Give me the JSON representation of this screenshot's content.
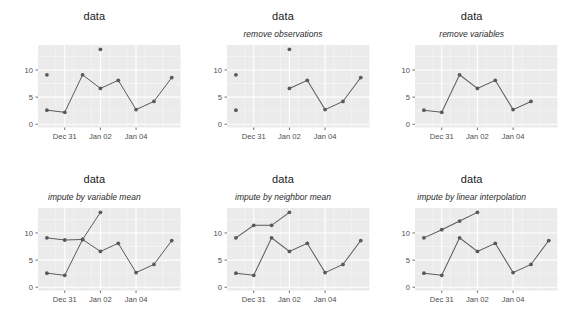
{
  "figure": {
    "background": "#ffffff",
    "panel_background": "#ebebeb",
    "grid_color": "#ffffff",
    "series_color": "#595959",
    "axis_text_color": "#4d4d4d",
    "rows": 2,
    "cols": 3
  },
  "panels": [
    {
      "id": "panel-data-original",
      "title": "data",
      "subtitle": ""
    },
    {
      "id": "panel-remove-observations",
      "title": "data",
      "subtitle": "remove observations"
    },
    {
      "id": "panel-remove-variables",
      "title": "data",
      "subtitle": "remove variables"
    },
    {
      "id": "panel-impute-variable-mean",
      "title": "data",
      "subtitle": "impute by variable mean"
    },
    {
      "id": "panel-impute-neighbor-mean",
      "title": "data",
      "subtitle": "impute by neighbor mean"
    },
    {
      "id": "panel-impute-linear-interp",
      "title": "data",
      "subtitle": "impute by linear interpolation"
    }
  ],
  "chart_data": [
    {
      "type": "line",
      "title": "data",
      "subtitle": "",
      "xlabel": "",
      "ylabel": "",
      "x": [
        0,
        1,
        2,
        3,
        4,
        5,
        6,
        7
      ],
      "xtick_positions": [
        1,
        3,
        5
      ],
      "xtick_labels": [
        "Dec 31",
        "Jan 02",
        "Jan 04"
      ],
      "ytick_labels": [
        "0",
        "5",
        "10"
      ],
      "ytick_values": [
        0,
        5,
        10
      ],
      "ylim": [
        -0.6,
        14.6
      ],
      "grid": true,
      "legend": "none",
      "series": [
        {
          "name": "series-a",
          "values": [
            9.1,
            null,
            null,
            13.8,
            null,
            null,
            null,
            null
          ]
        },
        {
          "name": "series-b",
          "values": [
            2.6,
            2.2,
            9.1,
            6.6,
            8.1,
            2.7,
            4.2,
            8.6
          ]
        }
      ]
    },
    {
      "type": "line",
      "title": "data",
      "subtitle": "remove observations",
      "xlabel": "",
      "ylabel": "",
      "x": [
        0,
        1,
        2,
        3,
        4,
        5,
        6,
        7
      ],
      "xtick_positions": [
        1,
        3,
        5
      ],
      "xtick_labels": [
        "Dec 31",
        "Jan 02",
        "Jan 04"
      ],
      "ytick_labels": [
        "0",
        "5",
        "10"
      ],
      "ytick_values": [
        0,
        5,
        10
      ],
      "ylim": [
        -0.6,
        14.6
      ],
      "grid": true,
      "legend": "none",
      "series": [
        {
          "name": "series-a",
          "values": [
            9.1,
            null,
            null,
            13.8,
            null,
            null,
            null,
            null
          ]
        },
        {
          "name": "series-b",
          "values": [
            2.6,
            null,
            null,
            6.6,
            8.1,
            2.7,
            4.2,
            8.6
          ]
        }
      ]
    },
    {
      "type": "line",
      "title": "data",
      "subtitle": "remove variables",
      "xlabel": "",
      "ylabel": "",
      "x": [
        0,
        1,
        2,
        3,
        4,
        5,
        6,
        7
      ],
      "xtick_positions": [
        1,
        3,
        5
      ],
      "xtick_labels": [
        "Dec 31",
        "Jan 02",
        "Jan 04"
      ],
      "ytick_labels": [
        "0",
        "5",
        "10"
      ],
      "ytick_values": [
        0,
        5,
        10
      ],
      "ylim": [
        -0.6,
        14.6
      ],
      "grid": true,
      "legend": "none",
      "series": [
        {
          "name": "series-b",
          "values": [
            2.6,
            2.2,
            9.1,
            6.6,
            8.1,
            2.7,
            4.2,
            null
          ]
        }
      ]
    },
    {
      "type": "line",
      "title": "data",
      "subtitle": "impute by variable mean",
      "xlabel": "",
      "ylabel": "",
      "x": [
        0,
        1,
        2,
        3,
        4,
        5,
        6,
        7
      ],
      "xtick_positions": [
        1,
        3,
        5
      ],
      "xtick_labels": [
        "Dec 31",
        "Jan 02",
        "Jan 04"
      ],
      "ytick_labels": [
        "0",
        "5",
        "10"
      ],
      "ytick_values": [
        0,
        5,
        10
      ],
      "ylim": [
        -0.6,
        14.6
      ],
      "grid": true,
      "legend": "none",
      "series": [
        {
          "name": "series-a",
          "values": [
            9.1,
            8.7,
            8.8,
            13.8,
            null,
            null,
            null,
            null
          ]
        },
        {
          "name": "series-b",
          "values": [
            2.6,
            2.2,
            8.8,
            6.6,
            8.1,
            2.7,
            4.2,
            8.6
          ]
        }
      ]
    },
    {
      "type": "line",
      "title": "data",
      "subtitle": "impute by neighbor mean",
      "xlabel": "",
      "ylabel": "",
      "x": [
        0,
        1,
        2,
        3,
        4,
        5,
        6,
        7
      ],
      "xtick_positions": [
        1,
        3,
        5
      ],
      "xtick_labels": [
        "Dec 31",
        "Jan 02",
        "Jan 04"
      ],
      "ytick_labels": [
        "0",
        "5",
        "10"
      ],
      "ytick_values": [
        0,
        5,
        10
      ],
      "ylim": [
        -0.6,
        14.6
      ],
      "grid": true,
      "legend": "none",
      "series": [
        {
          "name": "series-a",
          "values": [
            9.1,
            11.4,
            11.4,
            13.8,
            null,
            null,
            null,
            null
          ]
        },
        {
          "name": "series-b",
          "values": [
            2.6,
            2.2,
            9.1,
            6.6,
            8.1,
            2.7,
            4.2,
            8.6
          ]
        }
      ]
    },
    {
      "type": "line",
      "title": "data",
      "subtitle": "impute by linear interpolation",
      "xlabel": "",
      "ylabel": "",
      "x": [
        0,
        1,
        2,
        3,
        4,
        5,
        6,
        7
      ],
      "xtick_positions": [
        1,
        3,
        5
      ],
      "xtick_labels": [
        "Dec 31",
        "Jan 02",
        "Jan 04"
      ],
      "ytick_labels": [
        "0",
        "5",
        "10"
      ],
      "ytick_values": [
        0,
        5,
        10
      ],
      "ylim": [
        -0.6,
        14.6
      ],
      "grid": true,
      "legend": "none",
      "series": [
        {
          "name": "series-a",
          "values": [
            9.1,
            10.6,
            12.2,
            13.8,
            null,
            null,
            null,
            null
          ]
        },
        {
          "name": "series-b",
          "values": [
            2.6,
            2.2,
            9.1,
            6.6,
            8.1,
            2.7,
            4.2,
            8.6
          ]
        }
      ]
    }
  ]
}
